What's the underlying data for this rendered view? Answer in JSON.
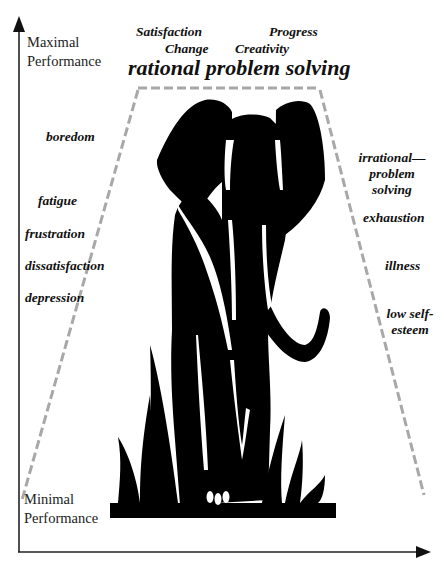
{
  "axes": {
    "y_top_label": [
      "Maximal",
      "Performance"
    ],
    "y_bottom_label": [
      "Minimal",
      "Performance"
    ]
  },
  "top": {
    "satisfaction": "Satisfaction",
    "change": "Change",
    "progress": "Progress",
    "creativity": "Creativity",
    "headline": "rational problem solving"
  },
  "left_states": {
    "items": [
      "boredom",
      "fatigue",
      "frustration",
      "dissatisfaction",
      "depression"
    ]
  },
  "right_states": {
    "irrational": [
      "irrational—",
      "problem",
      "solving"
    ],
    "exhaustion": "exhaustion",
    "illness": "illness",
    "low_self_esteem": [
      "low self-",
      "esteem"
    ]
  },
  "colors": {
    "ink": "#000000",
    "axis": "#222222",
    "dashed": "#a8a8a8",
    "background": "#ffffff"
  }
}
